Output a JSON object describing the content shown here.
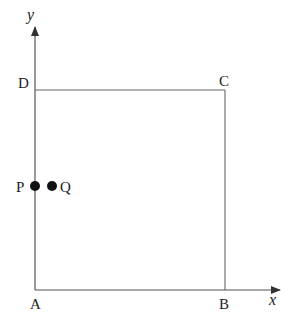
{
  "diagram": {
    "axes": {
      "x_label": "x",
      "y_label": "y"
    },
    "vertices": {
      "A": "A",
      "B": "B",
      "C": "C",
      "D": "D"
    },
    "points": {
      "P": "P",
      "Q": "Q"
    },
    "colors": {
      "line": "#555555",
      "dot": "#111111",
      "text": "#222222"
    }
  }
}
